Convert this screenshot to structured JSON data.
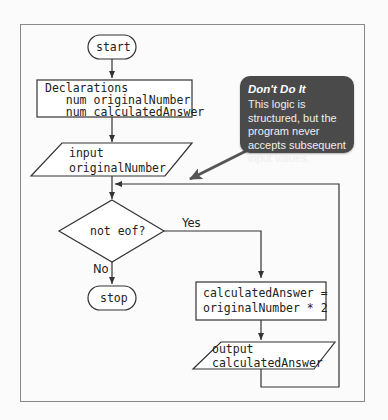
{
  "flowchart": {
    "start": {
      "label": "start"
    },
    "declarations": {
      "line1": "Declarations",
      "line2": "   num originalNumber",
      "line3": "   num calculatedAnswer"
    },
    "input": {
      "line1": "input",
      "line2": "originalNumber"
    },
    "decision": {
      "label": "not eof?",
      "yes_label": "Yes",
      "no_label": "No"
    },
    "stop": {
      "label": "stop"
    },
    "process": {
      "line1": "calculatedAnswer =",
      "line2": "originalNumber * 2"
    },
    "output": {
      "line1": "output",
      "line2": "calculatedAnswer"
    }
  },
  "callout": {
    "title": "Don't Do It",
    "body": "This logic is structured, but the program never accepts subsequent input values."
  },
  "colors": {
    "stroke": "#333333",
    "frame": "#8a8a8a",
    "callout_bg": "#4a4a4a",
    "callout_arrow": "#555555"
  }
}
